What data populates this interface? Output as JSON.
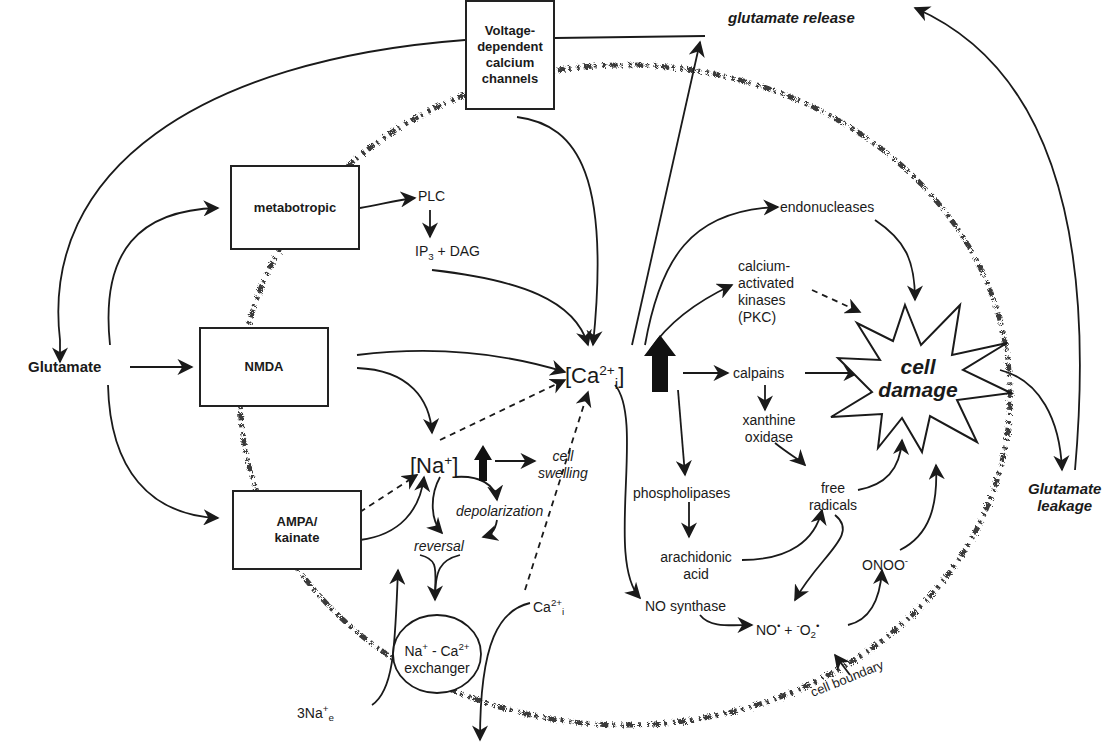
{
  "diagram": {
    "type": "pathway",
    "nodes": {
      "glutamate": "Glutamate",
      "glutamate_release": "glutamate release",
      "glutamate_leakage_1": "Glutamate",
      "glutamate_leakage_2": "leakage",
      "vdcc_1": "Voltage-",
      "vdcc_2": "dependent",
      "vdcc_3": "calcium",
      "vdcc_4": "channels",
      "metabotropic": "metabotropic",
      "nmda": "NMDA",
      "ampa_1": "AMPA/",
      "ampa_2": "kainate",
      "plc": "PLC",
      "ip3_dag_pre": "IP",
      "ip3_dag_sub": "3",
      "ip3_dag_post": " + DAG",
      "ca_open": "[Ca",
      "ca_sup": "2+",
      "ca_sub": "i",
      "ca_close": "]",
      "na_open": "[Na",
      "na_sup": "+",
      "na_close": "]",
      "cell_swelling_1": "cell",
      "cell_swelling_2": "swelling",
      "depolarization": "depolarization",
      "reversal": "reversal",
      "exchanger_1_a": "Na",
      "exchanger_1_sup1": "+",
      "exchanger_1_b": " - Ca",
      "exchanger_1_sup2": "2+",
      "exchanger_2": "exchanger",
      "three_na_pre": "3Na",
      "three_na_sup": "+",
      "three_na_sub": "e",
      "ca_i_small_pre": "Ca",
      "ca_i_small_sup": "2+",
      "ca_i_small_sub": "i",
      "endonucleases": "endonucleases",
      "kinases_1": "calcium-",
      "kinases_2": "activated",
      "kinases_3": "kinases",
      "kinases_4": "(PKC)",
      "calpains": "calpains",
      "xanthine_1": "xanthine",
      "xanthine_2": "oxidase",
      "free_radicals_1": "free",
      "free_radicals_2": "radicals",
      "phospholipases": "phospholipases",
      "arachidonic_1": "arachidonic",
      "arachidonic_2": "acid",
      "no_synthase": "NO synthase",
      "no_radical": "NO",
      "superoxide_pre": " + ",
      "superoxide_minus": "-",
      "superoxide_o": "O",
      "superoxide_sub": "2",
      "dot": "•",
      "onoo": "ONOO",
      "onoo_sup": "-",
      "cell_damage_1": "cell",
      "cell_damage_2": "damage",
      "cell_boundary": "cell boundary"
    },
    "colors": {
      "ink": "#1a1a1a",
      "background": "#ffffff",
      "boundary_stipple": "#3a3a3a"
    }
  }
}
